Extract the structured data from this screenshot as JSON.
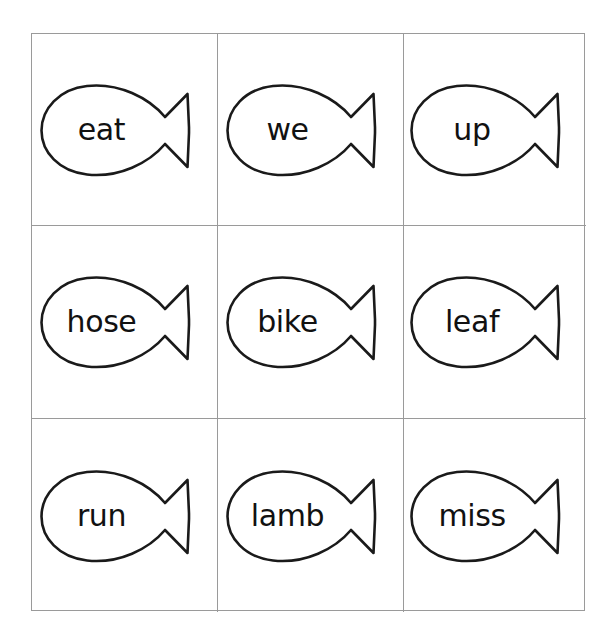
{
  "page": {
    "background_color": "#ffffff",
    "grid_line_color": "#9a9a9a",
    "outline_color": "#1a1a1a",
    "text_color": "#111111",
    "columns": 3,
    "rows": 3
  },
  "cards": [
    {
      "word": "eat",
      "row": 1,
      "col": 1,
      "icon": "fish-outline-icon"
    },
    {
      "word": "we",
      "row": 1,
      "col": 2,
      "icon": "fish-outline-icon"
    },
    {
      "word": "up",
      "row": 1,
      "col": 3,
      "icon": "fish-outline-icon"
    },
    {
      "word": "hose",
      "row": 2,
      "col": 1,
      "icon": "fish-outline-icon"
    },
    {
      "word": "bike",
      "row": 2,
      "col": 2,
      "icon": "fish-outline-icon"
    },
    {
      "word": "leaf",
      "row": 2,
      "col": 3,
      "icon": "fish-outline-icon"
    },
    {
      "word": "run",
      "row": 3,
      "col": 1,
      "icon": "fish-outline-icon"
    },
    {
      "word": "lamb",
      "row": 3,
      "col": 2,
      "icon": "fish-outline-icon"
    },
    {
      "word": "miss",
      "row": 3,
      "col": 3,
      "icon": "fish-outline-icon"
    }
  ]
}
